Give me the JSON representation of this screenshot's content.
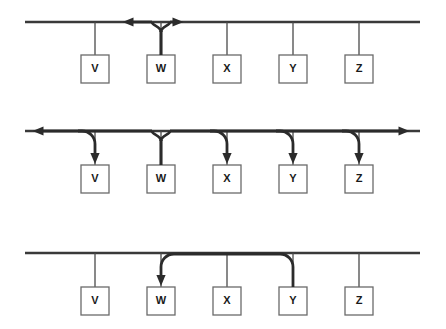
{
  "diagram": {
    "type": "network-bus-diagram",
    "colors": {
      "bus": "#3a3a3a",
      "drop_line": "#4a4a4a",
      "signal": "#2b2b2b",
      "box_stroke": "#6a6a6a",
      "box_fill": "#ffffff",
      "label": "#1a1a1a",
      "background": "#ffffff"
    },
    "stations": [
      {
        "id": "v",
        "label": "V",
        "x": 95
      },
      {
        "id": "w",
        "label": "W",
        "x": 161
      },
      {
        "id": "x",
        "label": "X",
        "x": 227
      },
      {
        "id": "y",
        "label": "Y",
        "x": 293
      },
      {
        "id": "z",
        "label": "Z",
        "x": 359
      }
    ],
    "box": {
      "width": 28,
      "height": 28
    },
    "panels": [
      {
        "id": "panel-1",
        "name": "transmit",
        "caption": "W transmits onto the bus in both directions",
        "bus_y": 22,
        "bus_x_start": 25,
        "bus_x_end": 420,
        "box_top": 55,
        "source": "w",
        "arrows": [
          "left",
          "right"
        ],
        "left_arrow_x": 128,
        "right_arrow_x": 178,
        "receivers": []
      },
      {
        "id": "panel-2",
        "name": "propagate",
        "caption": "Signal propagates to both ends and every station receives it",
        "bus_y": 131,
        "bus_x_start": 25,
        "bus_x_end": 420,
        "box_top": 165,
        "source": "w",
        "arrows": [
          "left",
          "right"
        ],
        "left_arrow_x": 38,
        "right_arrow_x": 404,
        "receivers": [
          "v",
          "x",
          "y",
          "z"
        ]
      },
      {
        "id": "panel-3",
        "name": "unicast",
        "caption": "Y sends a frame addressed to W",
        "bus_y": 253,
        "bus_x_start": 25,
        "bus_x_end": 420,
        "box_top": 287,
        "source": "y",
        "arrows": [],
        "destination": "w",
        "receivers": [
          "w"
        ]
      }
    ]
  }
}
